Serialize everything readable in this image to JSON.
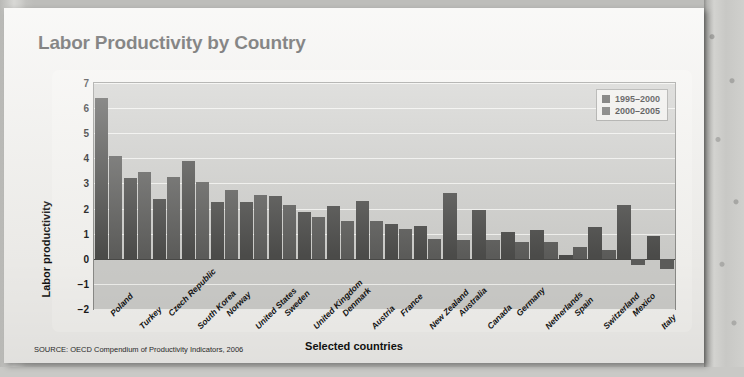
{
  "title": "Labor Productivity by Country",
  "source": "SOURCE: OECD Compendium of Productivity Indicators, 2006",
  "legend": {
    "position": "top-right",
    "entries": [
      {
        "label": "1995–2000",
        "color": "#4d4d4b",
        "icon": "legend-swatch"
      },
      {
        "label": "2000–2005",
        "color": "#5e5e5c",
        "icon": "legend-swatch"
      }
    ]
  },
  "chart_data": {
    "type": "bar",
    "title": "Labor Productivity by Country",
    "xlabel": "Selected countries",
    "ylabel": "Labor productivity",
    "ylim": [
      -2,
      7
    ],
    "yticks": [
      7,
      6,
      5,
      4,
      3,
      2,
      1,
      0,
      -1,
      -2
    ],
    "grid": true,
    "legend_position": "top-right",
    "categories": [
      "Poland",
      "Turkey",
      "Czech Republic",
      "South Korea",
      "Norway",
      "United States",
      "Sweden",
      "United Kingdom",
      "Denmark",
      "Austria",
      "France",
      "New Zealand",
      "Australia",
      "Canada",
      "Germany",
      "Netherlands",
      "Spain",
      "Switzerland",
      "Mexico",
      "Italy"
    ],
    "series": [
      {
        "name": "1995–2000",
        "color": "#4d4d4b",
        "values": [
          6.4,
          3.2,
          2.4,
          3.9,
          2.25,
          2.25,
          2.5,
          1.85,
          2.1,
          2.3,
          1.4,
          1.3,
          2.6,
          1.95,
          1.05,
          1.15,
          0.15,
          1.25,
          2.15,
          0.9
        ]
      },
      {
        "name": "2000–2005",
        "color": "#5e5e5c",
        "values": [
          4.1,
          3.45,
          3.25,
          3.05,
          2.75,
          2.55,
          2.15,
          1.65,
          1.5,
          1.5,
          1.2,
          0.8,
          0.75,
          0.75,
          0.65,
          0.65,
          0.45,
          0.35,
          -0.25,
          -0.4
        ]
      }
    ]
  }
}
